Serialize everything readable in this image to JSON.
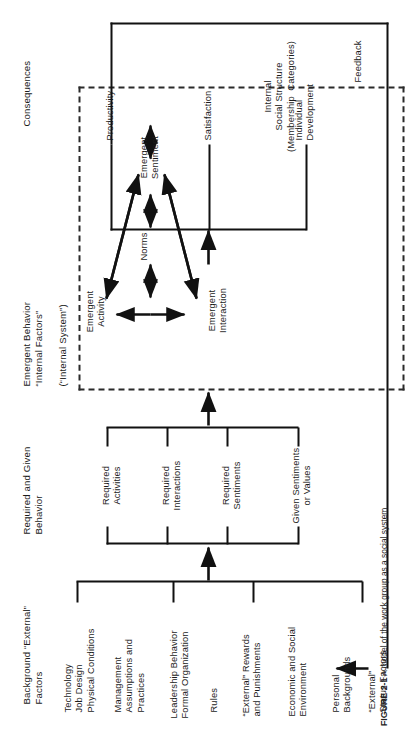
{
  "figure": {
    "orientation": "rotated-90-ccw",
    "caption_prefix": "FIGURE 2-1",
    "caption_text": "A model of the work group as a social system"
  },
  "sections": {
    "consequences": "Consequences",
    "emergent_behavior": "Emergent Behavior\n“Internal Factors”",
    "internal_system": "(“Internal System”)",
    "required_given": "Required and Given\nBehavior",
    "background": "Background “External”\nFactors",
    "feedback": "Feedback"
  },
  "consequences_items": [
    {
      "id": "productivity",
      "label": "Productivity"
    },
    {
      "id": "satisfaction",
      "label": "Satisfaction"
    },
    {
      "id": "individual-development",
      "label": "Individual\nDevelopment"
    }
  ],
  "internal_nodes": [
    {
      "id": "emergent-activity",
      "label": "Emergent\nActivity"
    },
    {
      "id": "norms",
      "label": "Norms"
    },
    {
      "id": "emergent-interaction",
      "label": "Emergent\nInteraction"
    },
    {
      "id": "emergent-sentiment",
      "label": "Emergent\nSentiment"
    },
    {
      "id": "internal-social-structure",
      "label": "Internal\nSocial Structure\n(Membership  Categories)"
    }
  ],
  "required_given_items": [
    {
      "id": "required-activities",
      "label": "Required\nActivities"
    },
    {
      "id": "required-interactions",
      "label": "Required\nInteractions"
    },
    {
      "id": "required-sentiments",
      "label": "Required\nSentiments"
    },
    {
      "id": "given-sentiments-or-values",
      "label": "Given Sentiments\nor Values"
    }
  ],
  "background_items": [
    {
      "id": "technology-job-design",
      "label": "Technology\nJob Design\nPhysical Conditions"
    },
    {
      "id": "management-assumptions",
      "label": "Management\nAssumptions and\nPractices"
    },
    {
      "id": "leadership-behavior",
      "label": "Leadership Behavior\nFormal Organization"
    },
    {
      "id": "rules",
      "label": "Rules"
    },
    {
      "id": "external-rewards",
      "label": "“External” Rewards\nand Punishments"
    },
    {
      "id": "economic-social-environment",
      "label": "Economic and Social\nEnvironment"
    },
    {
      "id": "personal-backgrounds",
      "label": "Personal\nBackgrounds"
    },
    {
      "id": "external-status-factors",
      "label": "“External”\nStatus Factors"
    }
  ],
  "colors": {
    "ink": "#1a1a1a",
    "line": "#111111",
    "dashed": "#2a2a2a",
    "paper": "#ffffff"
  }
}
